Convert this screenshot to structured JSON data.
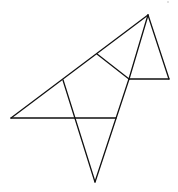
{
  "diagram": {
    "type": "geometric-net",
    "stroke_color": "#111111",
    "background_color": "#ffffff",
    "shapes": [
      {
        "name": "large-triangle-left",
        "kind": "triangle"
      },
      {
        "name": "central-quadrilateral",
        "kind": "quadrilateral"
      },
      {
        "name": "upper-small-triangle",
        "kind": "triangle"
      },
      {
        "name": "right-small-triangle",
        "kind": "triangle"
      },
      {
        "name": "bottom-triangle",
        "kind": "triangle"
      }
    ],
    "labels": []
  }
}
